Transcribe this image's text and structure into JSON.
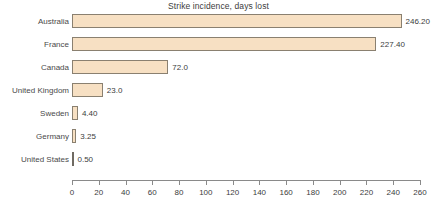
{
  "chart_data": {
    "type": "bar",
    "orientation": "horizontal",
    "title": "Strike incidence, days lost",
    "xlabel": "",
    "ylabel": "",
    "categories": [
      "Australia",
      "France",
      "Canada",
      "United Kingdom",
      "Sweden",
      "Germany",
      "United States"
    ],
    "values": [
      246.2,
      227.4,
      72.0,
      23.0,
      4.4,
      3.25,
      0.5
    ],
    "value_labels": [
      "246.20",
      "227.40",
      "72.0",
      "23.0",
      "4.40",
      "3.25",
      "0.50"
    ],
    "xlim": [
      0,
      260
    ],
    "xticks": [
      0,
      20,
      40,
      60,
      80,
      100,
      120,
      140,
      160,
      180,
      200,
      220,
      240,
      260
    ],
    "xtick_labels": [
      "0",
      "20",
      "40",
      "60",
      "80",
      "100",
      "120",
      "140",
      "160",
      "180",
      "200",
      "220",
      "240",
      "260"
    ],
    "grid": false,
    "legend": "none",
    "colors": {
      "bar_fill": "#f7e0c3",
      "bar_border": "#8a8070",
      "text": "#3c3c3c",
      "axis": "#8a8a8a",
      "background": "#ffffff"
    }
  }
}
